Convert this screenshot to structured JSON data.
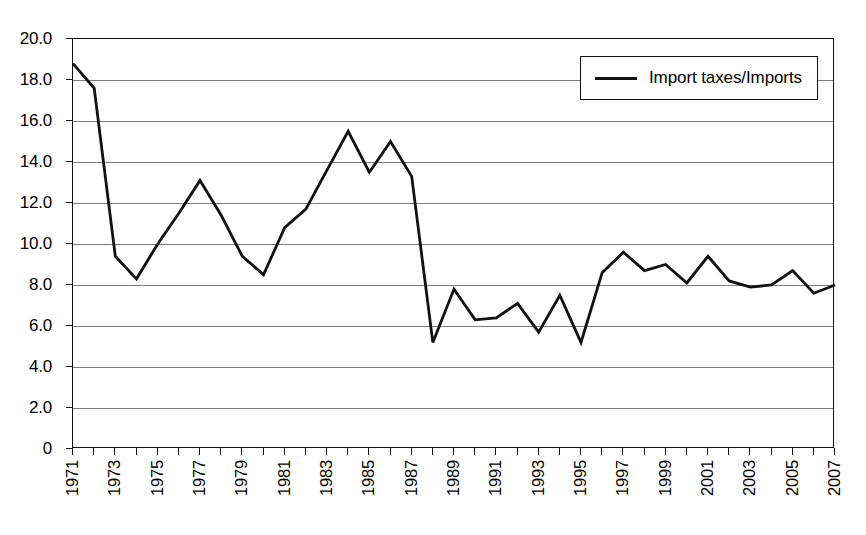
{
  "chart_data": {
    "type": "line",
    "title": "",
    "subtitle": "",
    "xlabel": "",
    "ylabel": "",
    "grid": true,
    "legend_position": "top-right",
    "xlim": [
      1971,
      2007
    ],
    "ylim": [
      0,
      20
    ],
    "y_ticks": [
      "0",
      "2.0",
      "4.0",
      "6.0",
      "8.0",
      "10.0",
      "12.0",
      "14.0",
      "16.0",
      "18.0",
      "20.0"
    ],
    "y_tick_values": [
      0,
      2,
      4,
      6,
      8,
      10,
      12,
      14,
      16,
      18,
      20
    ],
    "x_tick_labels": [
      "1971",
      "1973",
      "1975",
      "1977",
      "1979",
      "1981",
      "1983",
      "1985",
      "1987",
      "1989",
      "1991",
      "1993",
      "1995",
      "1997",
      "1999",
      "2001",
      "2003",
      "2005",
      "2007"
    ],
    "x_tick_values": [
      1971,
      1973,
      1975,
      1977,
      1979,
      1981,
      1983,
      1985,
      1987,
      1989,
      1991,
      1993,
      1995,
      1997,
      1999,
      2001,
      2003,
      2005,
      2007
    ],
    "series": [
      {
        "name": "Import taxes/Imports",
        "color": "#111111",
        "x": [
          1971,
          1972,
          1973,
          1974,
          1975,
          1976,
          1977,
          1978,
          1979,
          1980,
          1981,
          1982,
          1983,
          1984,
          1985,
          1986,
          1987,
          1988,
          1989,
          1990,
          1991,
          1992,
          1993,
          1994,
          1995,
          1996,
          1997,
          1998,
          1999,
          2000,
          2001,
          2002,
          2003,
          2004,
          2005,
          2006,
          2007
        ],
        "values": [
          18.8,
          17.6,
          9.4,
          8.3,
          10.0,
          11.5,
          13.1,
          11.4,
          9.4,
          8.5,
          10.8,
          11.7,
          13.6,
          15.5,
          13.5,
          15.0,
          13.3,
          5.2,
          7.8,
          6.3,
          6.4,
          7.1,
          5.7,
          7.5,
          5.2,
          8.6,
          9.6,
          8.7,
          9.0,
          8.1,
          9.4,
          8.2,
          7.9,
          8.0,
          8.7,
          7.6,
          8.0
        ]
      }
    ]
  },
  "legend": {
    "entries": [
      {
        "label": "Import taxes/Imports"
      }
    ]
  }
}
